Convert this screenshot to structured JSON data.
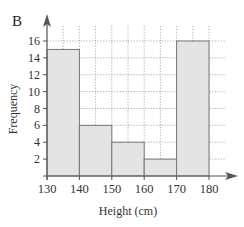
{
  "panel_label": "B",
  "chart_data": {
    "type": "bar",
    "subtype": "histogram",
    "title": "",
    "xlabel": "Height (cm)",
    "ylabel": "Frequency",
    "bins": [
      {
        "from": 130,
        "to": 140,
        "frequency": 15
      },
      {
        "from": 140,
        "to": 150,
        "frequency": 6
      },
      {
        "from": 150,
        "to": 160,
        "frequency": 4
      },
      {
        "from": 160,
        "to": 170,
        "frequency": 2
      },
      {
        "from": 170,
        "to": 180,
        "frequency": 16
      }
    ],
    "categories": [
      "130-140",
      "140-150",
      "150-160",
      "160-170",
      "170-180"
    ],
    "values": [
      15,
      6,
      4,
      2,
      16
    ],
    "xticks": [
      130,
      140,
      150,
      160,
      170,
      180
    ],
    "yticks": [
      2,
      4,
      6,
      8,
      10,
      12,
      14,
      16
    ],
    "xlim": [
      130,
      180
    ],
    "ylim": [
      0,
      16
    ],
    "grid": true,
    "grid_style": "dotted, minor gridlines every 5 cm on x and every 2 on y",
    "bar_fill": "#e4e4e4",
    "bar_edge": "#777777",
    "legend": null
  }
}
